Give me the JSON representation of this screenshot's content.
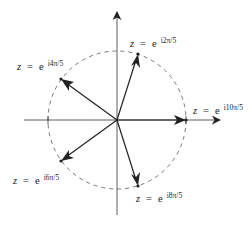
{
  "diagram": {
    "center": [
      117,
      120
    ],
    "radius": 69,
    "colors": {
      "axis": "#333333",
      "vector": "#222222",
      "circle": "#555555",
      "text": "#222222"
    },
    "axes": {
      "horizontal": {
        "x1": 24,
        "x2": 220,
        "y": 120
      },
      "vertical": {
        "x": 117,
        "y1": 12,
        "y2": 215
      }
    },
    "points": [
      {
        "id": "p1",
        "angle": "2π/5",
        "x": 138,
        "y": 54,
        "label": {
          "z": "z",
          "eq": "=",
          "base": "e",
          "exponent": "i2π/5"
        }
      },
      {
        "id": "p2",
        "angle": "4π/5",
        "x": 61,
        "y": 79,
        "label": {
          "z": "z",
          "eq": "=",
          "base": "e",
          "exponent": "i4π/5"
        }
      },
      {
        "id": "p3",
        "angle": "6π/5",
        "x": 61,
        "y": 161,
        "label": {
          "z": "z",
          "eq": "=",
          "base": "e",
          "exponent": "i6π/5"
        }
      },
      {
        "id": "p4",
        "angle": "8π/5",
        "x": 138,
        "y": 186,
        "label": {
          "z": "z",
          "eq": "=",
          "base": "e",
          "exponent": "i8π/5"
        }
      },
      {
        "id": "p5",
        "angle": "10π/5",
        "x": 186,
        "y": 120,
        "label": {
          "z": "z",
          "eq": "=",
          "base": "e",
          "exponent": "i10π/5"
        }
      }
    ]
  }
}
